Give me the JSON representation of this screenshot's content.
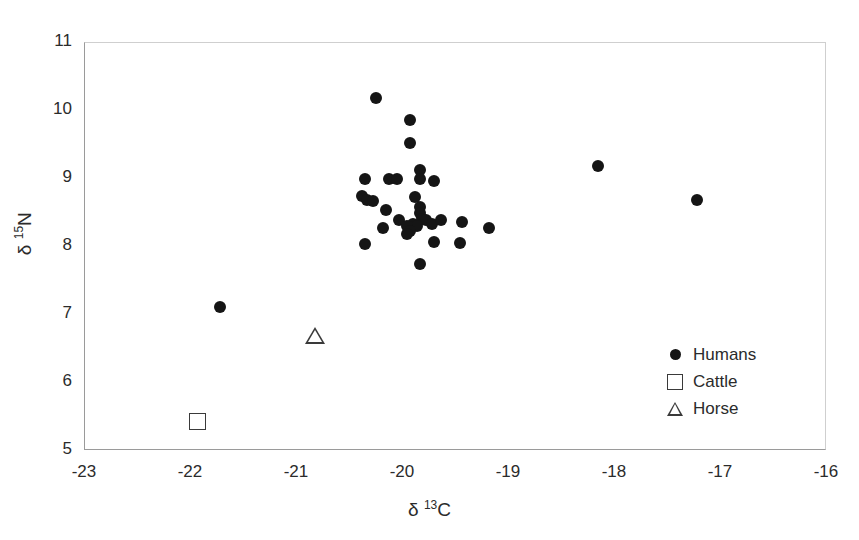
{
  "figure": {
    "background": "#ffffff",
    "frame_color": "#9a9a9a",
    "marker_color": "#151515",
    "open_marker_color": "#3a3a3a"
  },
  "chart_data": {
    "type": "scatter",
    "title": "",
    "xlabel_parts": {
      "delta": "δ",
      "sup": "13",
      "element": "C"
    },
    "ylabel_parts": {
      "delta": "δ",
      "sup": "15",
      "element": "N"
    },
    "xlabel": "δ 13C",
    "ylabel": "δ 15N",
    "xlim": [
      -23,
      -16
    ],
    "ylim": [
      5,
      11
    ],
    "xticks": [
      -23,
      -22,
      -21,
      -20,
      -19,
      -18,
      -17,
      -16
    ],
    "yticks": [
      5,
      6,
      7,
      8,
      9,
      10,
      11
    ],
    "xtick_labels": [
      "-23",
      "-22",
      "-21",
      "-20",
      "-19",
      "-18",
      "-17",
      "-16"
    ],
    "ytick_labels": [
      "5",
      "6",
      "7",
      "8",
      "9",
      "10",
      "11"
    ],
    "grid": false,
    "legend_position": "lower-right-inside",
    "series": [
      {
        "name": "Humans",
        "marker": "filled-circle",
        "color": "#151515",
        "points": [
          [
            -21.72,
            7.11
          ],
          [
            -20.25,
            10.17
          ],
          [
            -19.92,
            9.85
          ],
          [
            -19.92,
            9.52
          ],
          [
            -19.83,
            9.12
          ],
          [
            -19.83,
            8.98
          ],
          [
            -19.7,
            8.95
          ],
          [
            -20.35,
            8.98
          ],
          [
            -20.12,
            8.98
          ],
          [
            -20.05,
            8.98
          ],
          [
            -20.38,
            8.74
          ],
          [
            -20.33,
            8.68
          ],
          [
            -20.27,
            8.66
          ],
          [
            -19.88,
            8.72
          ],
          [
            -20.15,
            8.53
          ],
          [
            -19.83,
            8.58
          ],
          [
            -19.83,
            8.48
          ],
          [
            -19.81,
            8.4
          ],
          [
            -19.77,
            8.38
          ],
          [
            -20.03,
            8.38
          ],
          [
            -19.9,
            8.33
          ],
          [
            -19.86,
            8.3
          ],
          [
            -19.95,
            8.3
          ],
          [
            -19.72,
            8.33
          ],
          [
            -19.63,
            8.38
          ],
          [
            -19.43,
            8.36
          ],
          [
            -19.18,
            8.27
          ],
          [
            -20.18,
            8.27
          ],
          [
            -19.92,
            8.22
          ],
          [
            -19.95,
            8.18
          ],
          [
            -19.7,
            8.06
          ],
          [
            -19.45,
            8.04
          ],
          [
            -20.35,
            8.03
          ],
          [
            -19.83,
            7.74
          ],
          [
            -18.15,
            9.17
          ],
          [
            -17.22,
            8.68
          ]
        ]
      },
      {
        "name": "Cattle",
        "marker": "open-square",
        "color": "#3a3a3a",
        "points": [
          [
            -21.93,
            5.42
          ]
        ]
      },
      {
        "name": "Horse",
        "marker": "open-triangle",
        "color": "#3a3a3a",
        "points": [
          [
            -20.82,
            6.68
          ]
        ]
      }
    ]
  },
  "legend": {
    "items": [
      {
        "label": "Humans",
        "marker": "filled-circle"
      },
      {
        "label": "Cattle",
        "marker": "open-square"
      },
      {
        "label": "Horse",
        "marker": "open-triangle"
      }
    ]
  }
}
